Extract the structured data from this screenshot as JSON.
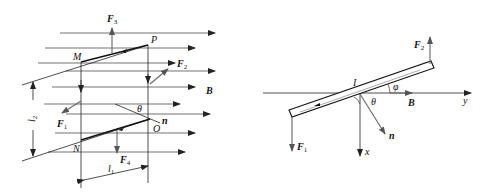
{
  "figure_left": {
    "field_label": "B",
    "points": {
      "M": "M",
      "P": "P",
      "N": "N",
      "O": "O"
    },
    "forces": {
      "F1": {
        "main": "F",
        "sub": "1"
      },
      "F2": {
        "main": "F",
        "sub": "2"
      },
      "F3": {
        "main": "F",
        "sub": "3"
      },
      "F4": {
        "main": "F",
        "sub": "4"
      }
    },
    "normal_label": "n",
    "angle_label": "θ",
    "dimensions": {
      "l1": {
        "main": "l",
        "sub": "1"
      },
      "l2": {
        "main": "l",
        "sub": "2"
      }
    }
  },
  "figure_right": {
    "current_label": "I",
    "field_label": "B",
    "normal_label": "n",
    "angle_theta": "θ",
    "angle_phi": "φ",
    "axis_x": "x",
    "axis_y": "y",
    "forces": {
      "F1": {
        "main": "F",
        "sub": "1"
      },
      "F2": {
        "main": "F",
        "sub": "2"
      }
    }
  }
}
